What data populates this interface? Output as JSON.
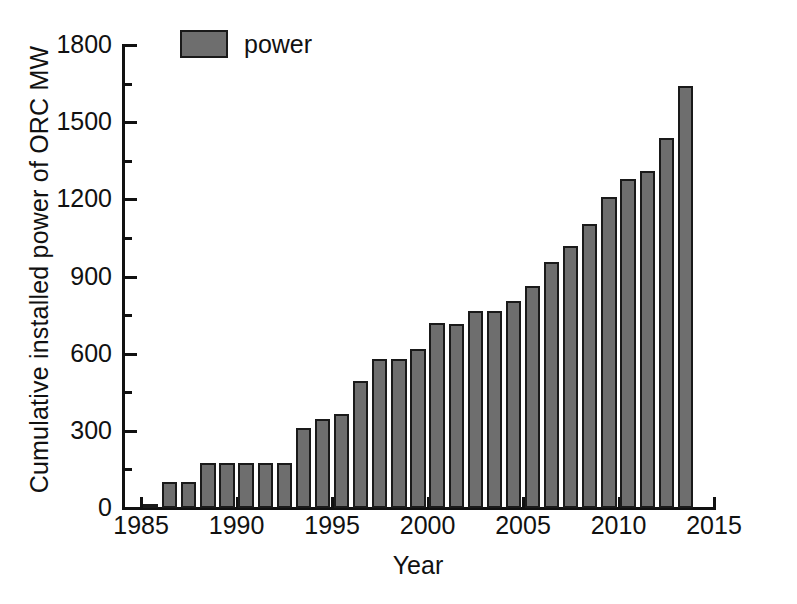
{
  "chart_data": {
    "type": "bar",
    "title": "",
    "xlabel": "Year",
    "ylabel": "Cumulative installed power of ORC MW",
    "legend": [
      {
        "name": "power",
        "color": "#6e6e6e"
      }
    ],
    "legend_position": "top-left-inside",
    "grid": false,
    "xlim": [
      1984,
      2015
    ],
    "ylim": [
      0,
      1800
    ],
    "y_major_ticks": [
      0,
      300,
      600,
      900,
      1200,
      1500,
      1800
    ],
    "y_minor_ticks": [
      150,
      450,
      750,
      1050,
      1350,
      1650
    ],
    "y_tick_labels": [
      "0",
      "300",
      "600",
      "900",
      "1200",
      "1500",
      "1800"
    ],
    "x_major_ticks": [
      1985,
      1990,
      1995,
      2000,
      2005,
      2010,
      2015
    ],
    "x_tick_labels": [
      "1985",
      "1990",
      "1995",
      "2000",
      "2005",
      "2010",
      "2015"
    ],
    "categories": [
      "1985",
      "1986",
      "1987",
      "1988",
      "1989",
      "1990",
      "1991",
      "1992",
      "1993",
      "1994",
      "1995",
      "1996",
      "1997",
      "1998",
      "1999",
      "2000",
      "2001",
      "2002",
      "2003",
      "2004",
      "2005",
      "2006",
      "2007",
      "2008",
      "2009",
      "2010",
      "2011",
      "2012",
      "2013"
    ],
    "values": [
      8,
      100,
      100,
      175,
      175,
      175,
      175,
      175,
      310,
      345,
      365,
      495,
      580,
      578,
      618,
      720,
      715,
      765,
      765,
      805,
      862,
      955,
      1020,
      1105,
      1210,
      1278,
      1310,
      1440,
      1640
    ],
    "series": [
      {
        "name": "power",
        "color": "#6e6e6e",
        "values": [
          8,
          100,
          100,
          175,
          175,
          175,
          175,
          175,
          310,
          345,
          365,
          495,
          580,
          578,
          618,
          720,
          715,
          765,
          765,
          805,
          862,
          955,
          1020,
          1105,
          1210,
          1278,
          1310,
          1440,
          1640
        ]
      }
    ]
  },
  "axes": {
    "y_title": "Cumulative installed power of ORC MW",
    "x_title": "Year"
  },
  "legend": {
    "label": "power"
  },
  "style": {
    "bar_fill": "#6e6e6e",
    "bar_stroke": "#1a1a1a",
    "axis_color": "#111111",
    "background": "#ffffff"
  }
}
